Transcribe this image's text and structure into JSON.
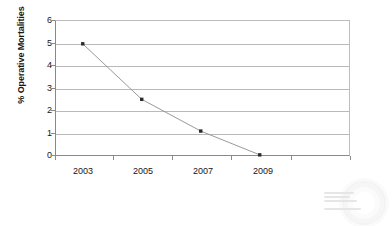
{
  "chart_data": {
    "type": "line",
    "title": "",
    "xlabel": "",
    "ylabel": "% Operative Mortalities",
    "categories": [
      "2003",
      "2005",
      "2007",
      "2009"
    ],
    "values": [
      4.95,
      2.5,
      1.1,
      0.05
    ],
    "series": [
      {
        "name": "% Operative Mortalities",
        "values": [
          4.95,
          2.5,
          1.1,
          0.05
        ]
      }
    ],
    "ylim": [
      0,
      6
    ],
    "yticks": [
      0,
      1,
      2,
      3,
      4,
      5,
      6
    ],
    "ytick_labels": [
      "0",
      "1",
      "2",
      "3",
      "4",
      "5",
      "6"
    ],
    "xtick_labels": [
      "2003",
      "2005",
      "2007",
      "2009"
    ],
    "grid": "horizontal",
    "legend": "none",
    "marker": "square",
    "colors": {
      "line": "#8d8d8d",
      "marker": "#2b2b2b",
      "gridline": "#b9b9b9",
      "axis": "#8a8a8a",
      "text": "#161616",
      "background": "#ffffff"
    }
  },
  "axes": {
    "y_title": "% Operative Mortalities"
  },
  "watermark": {
    "name": "faint-watermark"
  }
}
